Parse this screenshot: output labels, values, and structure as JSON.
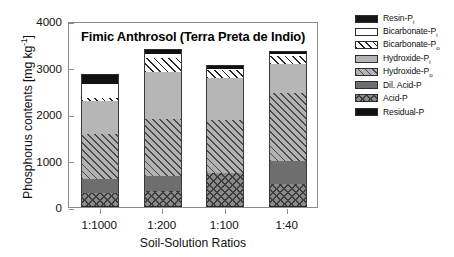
{
  "chart_data": {
    "type": "bar",
    "subtype": "stacked-bar",
    "title": "Fimic Anthrosol (Terra Preta de Indio)",
    "xlabel": "Soil-Solution Ratios",
    "ylabel": "Phosphorus contents [mg kg",
    "ylabel_sup": "-1",
    "ylabel_suffix": "]",
    "ylabel_full": "Phosphorus contents [mg kg-1]",
    "categories": [
      "1:1000",
      "1:200",
      "1:100",
      "1:40"
    ],
    "ylim": [
      0,
      4000
    ],
    "yticks": [
      0,
      1000,
      2000,
      3000,
      4000
    ],
    "ytick_labels": [
      "0",
      "1000",
      "2000",
      "3000",
      "4000"
    ],
    "grid": false,
    "legend_position": "right",
    "series": [
      {
        "name": "Acid-P",
        "key": "acid",
        "color": "#8a8a8a",
        "pattern": "crosshatch",
        "values": [
          310,
          355,
          730,
          490
        ]
      },
      {
        "name": "Dil. Acid-P",
        "key": "dilacid",
        "color": "#6e6e6e",
        "pattern": "solid-dark-gray",
        "values": [
          290,
          320,
          0,
          505
        ]
      },
      {
        "name": "Hydroxide-Po",
        "key": "hydrox_o",
        "color": "#b2b2b2",
        "pattern": "diagonal-hatch",
        "values": [
          970,
          1210,
          1140,
          1450
        ]
      },
      {
        "name": "Hydroxide-Pi",
        "key": "hydrox_i",
        "color": "#b6b6b6",
        "pattern": "solid-light-gray",
        "values": [
          710,
          1020,
          895,
          630
        ]
      },
      {
        "name": "Bicarbonate-Po",
        "key": "bicarb_o",
        "color": "#ffffff",
        "pattern": "diagonal-hatch",
        "values": [
          75,
          300,
          185,
          175
        ]
      },
      {
        "name": "Bicarbonate-Pi",
        "key": "bicarb_i",
        "color": "#ffffff",
        "pattern": "open-white",
        "values": [
          300,
          90,
          25,
          35
        ]
      },
      {
        "name": "Resin-Pi",
        "key": "resin",
        "color": "#151515",
        "pattern": "solid-black",
        "values": [
          0,
          0,
          0,
          0
        ]
      },
      {
        "name": "Residual-P",
        "key": "residual",
        "color": "#111111",
        "pattern": "solid-black",
        "values": [
          205,
          105,
          80,
          70
        ]
      }
    ],
    "stack_order_bottom_to_top": [
      "acid",
      "dilacid",
      "hydrox_o",
      "hydrox_i",
      "bicarb_o",
      "bicarb_i",
      "residual"
    ],
    "totals": [
      2860,
      3400,
      3055,
      3355
    ]
  },
  "legend": {
    "items": [
      {
        "label": "Resin-P",
        "sub": "i",
        "swatch": "resin"
      },
      {
        "label": "Bicarbonate-P",
        "sub": "i",
        "swatch": "bicarb-i"
      },
      {
        "label": "Bicarbonate-P",
        "sub": "o",
        "swatch": "bicarb-o"
      },
      {
        "label": "Hydroxide-P",
        "sub": "i",
        "swatch": "hydrox-i"
      },
      {
        "label": "Hydroxide-P",
        "sub": "o",
        "swatch": "hydrox-o"
      },
      {
        "label": "Dil. Acid-P",
        "sub": "",
        "swatch": "dilacid"
      },
      {
        "label": "Acid-P",
        "sub": "",
        "swatch": "acid"
      },
      {
        "label": "Residual-P",
        "sub": "",
        "swatch": "residual"
      }
    ]
  }
}
